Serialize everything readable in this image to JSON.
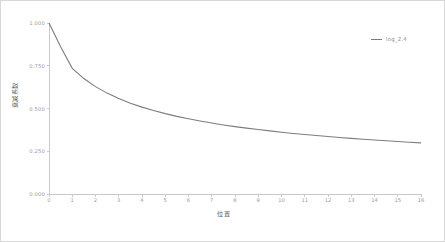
{
  "chart_data": {
    "type": "line",
    "title": "",
    "xlabel": "位置",
    "ylabel": "衰减系数",
    "xlim": [
      0,
      16
    ],
    "ylim": [
      0,
      1.0
    ],
    "grid": false,
    "legend_position": "top-right",
    "xticks": [
      "0",
      "1",
      "2",
      "3",
      "4",
      "5",
      "6",
      "7",
      "8",
      "9",
      "10",
      "11",
      "12",
      "13",
      "14",
      "15",
      "16"
    ],
    "yticks": [
      "0.000",
      "0.250",
      "0.500",
      "0.750",
      "1.000"
    ],
    "ytick_values": [
      0.0,
      0.25,
      0.5,
      0.75,
      1.0
    ],
    "series": [
      {
        "name": "log_2.4",
        "color": "#7d7d7d",
        "x": [
          0,
          0.5,
          1,
          1.5,
          2,
          2.5,
          3,
          3.5,
          4,
          4.5,
          5,
          5.5,
          6,
          6.5,
          7,
          7.5,
          8,
          8.5,
          9,
          9.5,
          10,
          10.5,
          11,
          11.5,
          12,
          12.5,
          13,
          13.5,
          14,
          14.5,
          15,
          15.5,
          16
        ],
        "values": [
          1.0,
          0.861,
          0.735,
          0.675,
          0.628,
          0.59,
          0.558,
          0.531,
          0.508,
          0.488,
          0.47,
          0.454,
          0.44,
          0.427,
          0.415,
          0.404,
          0.394,
          0.385,
          0.377,
          0.369,
          0.361,
          0.354,
          0.348,
          0.342,
          0.336,
          0.33,
          0.325,
          0.32,
          0.316,
          0.311,
          0.307,
          0.303,
          0.299
        ]
      }
    ]
  },
  "legend": {
    "entries": [
      {
        "label": "log_2.4",
        "color": "#7d7d7d"
      }
    ]
  },
  "axes": {
    "x_axis_label": "位置",
    "y_axis_label": "衰减系数"
  }
}
